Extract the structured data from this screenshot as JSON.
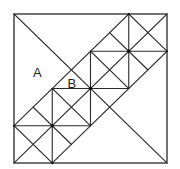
{
  "diagram": {
    "grid_units": 4,
    "labels": [
      {
        "text": "A",
        "gx": 0.6,
        "gy": 1.55
      },
      {
        "text": "B",
        "gx": 1.5,
        "gy": 1.85
      }
    ],
    "line_color": "#2a2a2a",
    "dot_color": "#111111"
  }
}
